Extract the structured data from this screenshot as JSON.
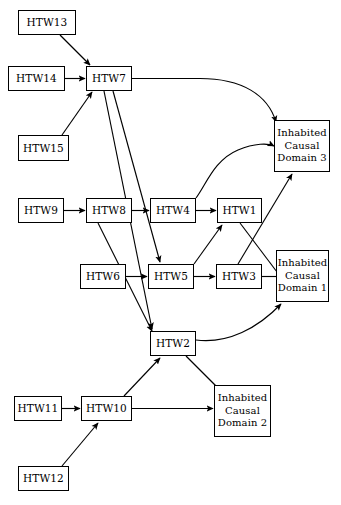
{
  "diagram": {
    "type": "directed-graph",
    "title": "",
    "background_color": "#ffffff",
    "stroke_color": "#000000",
    "nodes": [
      {
        "id": "HTW13",
        "label": "HTW13",
        "lines": [
          "HTW13"
        ],
        "x": 18,
        "y": 10,
        "w": 58,
        "h": 25
      },
      {
        "id": "HTW14",
        "label": "HTW14",
        "lines": [
          "HTW14"
        ],
        "x": 8,
        "y": 66,
        "w": 57,
        "h": 25
      },
      {
        "id": "HTW7",
        "label": "HTW7",
        "lines": [
          "HTW7"
        ],
        "x": 86,
        "y": 66,
        "w": 46,
        "h": 25
      },
      {
        "id": "HTW15",
        "label": "HTW15",
        "lines": [
          "HTW15"
        ],
        "x": 18,
        "y": 135,
        "w": 51,
        "h": 26
      },
      {
        "id": "ICD3",
        "label": "Inhabited Causal Domain 3",
        "lines": [
          "Inhabited",
          "Causal",
          "Domain 3"
        ],
        "x": 274,
        "y": 120,
        "w": 56,
        "h": 52
      },
      {
        "id": "HTW9",
        "label": "HTW9",
        "lines": [
          "HTW9"
        ],
        "x": 18,
        "y": 198,
        "w": 46,
        "h": 25
      },
      {
        "id": "HTW8",
        "label": "HTW8",
        "lines": [
          "HTW8"
        ],
        "x": 86,
        "y": 198,
        "w": 46,
        "h": 25
      },
      {
        "id": "HTW4",
        "label": "HTW4",
        "lines": [
          "HTW4"
        ],
        "x": 150,
        "y": 198,
        "w": 46,
        "h": 25
      },
      {
        "id": "HTW1",
        "label": "HTW1",
        "lines": [
          "HTW1"
        ],
        "x": 217,
        "y": 198,
        "w": 45,
        "h": 25
      },
      {
        "id": "HTW6",
        "label": "HTW6",
        "lines": [
          "HTW6"
        ],
        "x": 80,
        "y": 264,
        "w": 46,
        "h": 25
      },
      {
        "id": "HTW5",
        "label": "HTW5",
        "lines": [
          "HTW5"
        ],
        "x": 148,
        "y": 264,
        "w": 46,
        "h": 25
      },
      {
        "id": "HTW3",
        "label": "HTW3",
        "lines": [
          "HTW3"
        ],
        "x": 216,
        "y": 264,
        "w": 46,
        "h": 25
      },
      {
        "id": "ICD1",
        "label": "Inhabited Causal Domain 1",
        "lines": [
          "Inhabited",
          "Causal",
          "Domain 1"
        ],
        "x": 276,
        "y": 250,
        "w": 53,
        "h": 52
      },
      {
        "id": "HTW2",
        "label": "HTW2",
        "lines": [
          "HTW2"
        ],
        "x": 150,
        "y": 331,
        "w": 46,
        "h": 25
      },
      {
        "id": "HTW11",
        "label": "HTW11",
        "lines": [
          "HTW11"
        ],
        "x": 14,
        "y": 396,
        "w": 48,
        "h": 25
      },
      {
        "id": "HTW10",
        "label": "HTW10",
        "lines": [
          "HTW10"
        ],
        "x": 81,
        "y": 396,
        "w": 51,
        "h": 25
      },
      {
        "id": "ICD2",
        "label": "Inhabited Causal Domain 2",
        "lines": [
          "Inhabited",
          "Causal",
          "Domain 2"
        ],
        "x": 214,
        "y": 385,
        "w": 57,
        "h": 52
      },
      {
        "id": "HTW12",
        "label": "HTW12",
        "lines": [
          "HTW12"
        ],
        "x": 18,
        "y": 466,
        "w": 51,
        "h": 25
      }
    ],
    "edges": [
      {
        "from": "HTW13",
        "to": "HTW7",
        "style": "straight",
        "arrow": true
      },
      {
        "from": "HTW14",
        "to": "HTW7",
        "style": "straight",
        "arrow": true
      },
      {
        "from": "HTW15",
        "to": "HTW7",
        "style": "straight",
        "arrow": true
      },
      {
        "from": "HTW7",
        "to": "ICD3",
        "style": "curved",
        "arrow": true
      },
      {
        "from": "HTW7",
        "to": "HTW5",
        "style": "straight",
        "arrow": true
      },
      {
        "from": "HTW7",
        "to": "HTW2",
        "style": "straight",
        "arrow": true
      },
      {
        "from": "HTW9",
        "to": "HTW8",
        "style": "straight",
        "arrow": true
      },
      {
        "from": "HTW8",
        "to": "HTW4",
        "style": "straight",
        "arrow": true
      },
      {
        "from": "HTW8",
        "to": "HTW2",
        "style": "straight",
        "arrow": true
      },
      {
        "from": "HTW4",
        "to": "HTW1",
        "style": "straight",
        "arrow": true
      },
      {
        "from": "HTW4",
        "to": "ICD3",
        "style": "curved",
        "arrow": true
      },
      {
        "from": "HTW6",
        "to": "HTW5",
        "style": "straight",
        "arrow": true
      },
      {
        "from": "HTW5",
        "to": "HTW3",
        "style": "straight",
        "arrow": true
      },
      {
        "from": "HTW5",
        "to": "HTW1",
        "style": "straight",
        "arrow": true
      },
      {
        "from": "HTW1",
        "to": "ICD1",
        "style": "straight",
        "arrow": false
      },
      {
        "from": "HTW3",
        "to": "ICD3",
        "style": "straight",
        "arrow": true
      },
      {
        "from": "HTW3",
        "to": "ICD1",
        "style": "straight",
        "arrow": false
      },
      {
        "from": "HTW2",
        "to": "ICD1",
        "style": "curved",
        "arrow": true
      },
      {
        "from": "HTW2",
        "to": "ICD2",
        "style": "straight",
        "arrow": false
      },
      {
        "from": "HTW10",
        "to": "HTW2",
        "style": "straight",
        "arrow": true
      },
      {
        "from": "HTW10",
        "to": "ICD2",
        "style": "straight",
        "arrow": true
      },
      {
        "from": "HTW11",
        "to": "HTW10",
        "style": "straight",
        "arrow": true
      },
      {
        "from": "HTW12",
        "to": "HTW10",
        "style": "straight",
        "arrow": true
      }
    ]
  }
}
